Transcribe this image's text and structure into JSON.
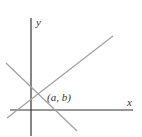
{
  "diagram": {
    "type": "coordinate-plane-intersecting-lines",
    "axes": {
      "x_label": "x",
      "y_label": "y",
      "x_axis": {
        "x1": 10,
        "y1": 110,
        "x2": 133,
        "y2": 110
      },
      "y_axis": {
        "x1": 31,
        "y1": 18,
        "x2": 31,
        "y2": 136
      },
      "color": "#333333"
    },
    "lines": [
      {
        "name": "rising-line",
        "x1": 7,
        "y1": 118,
        "x2": 113,
        "y2": 36,
        "color": "#a0a0a0"
      },
      {
        "name": "falling-line",
        "x1": 6,
        "y1": 63,
        "x2": 77,
        "y2": 131,
        "color": "#a0a0a0"
      }
    ],
    "intersection": {
      "label": "(a, b)",
      "x": 38,
      "y": 94
    },
    "label_positions": {
      "point": {
        "x": 47,
        "y": 101
      },
      "x": {
        "x": 127,
        "y": 106
      },
      "y": {
        "x": 36,
        "y": 26
      }
    }
  }
}
